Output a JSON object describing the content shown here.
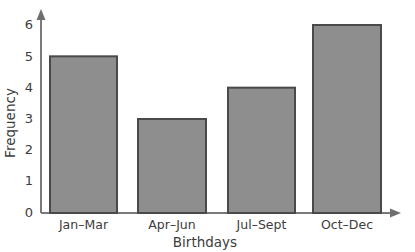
{
  "chart_data": {
    "type": "bar",
    "title": "",
    "xlabel": "Birthdays",
    "ylabel": "Frequency",
    "categories": [
      "Jan–Mar",
      "Apr–Jun",
      "Jul–Sept",
      "Oct–Dec"
    ],
    "values": [
      5,
      3,
      4,
      6
    ],
    "ylim": [
      0,
      6
    ],
    "ytick_labels": [
      "0",
      "1",
      "2",
      "3",
      "4",
      "5",
      "6"
    ],
    "ytick_values": [
      0,
      1,
      2,
      3,
      4,
      5,
      6
    ],
    "grid": false,
    "legend": false,
    "bar_fill_color": "#8e8e8e",
    "bar_border_color": "#4a4a4a",
    "axis_color": "#7a7a7a",
    "background_color": "#ffffff",
    "axis_arrows": true
  }
}
